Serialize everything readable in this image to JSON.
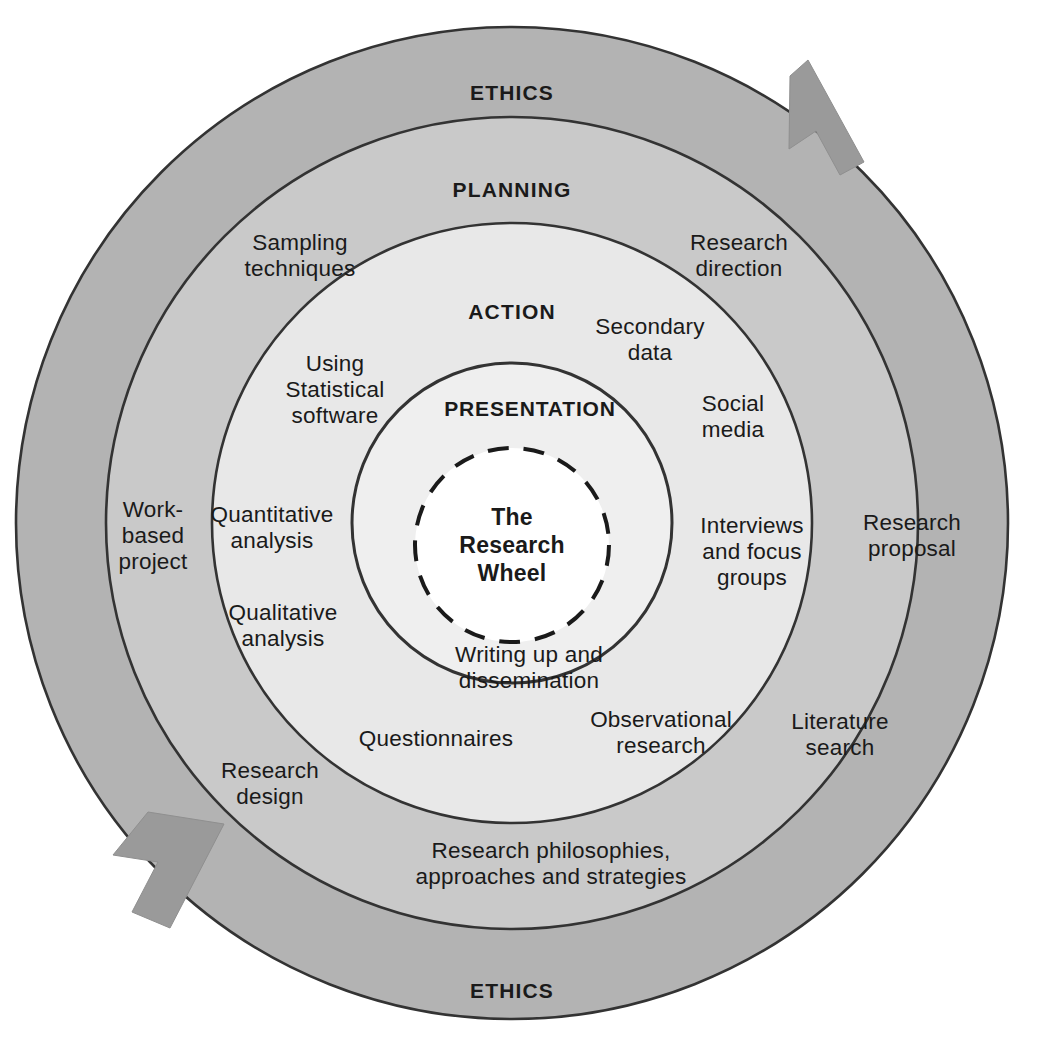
{
  "diagram": {
    "title": "The Research Wheel",
    "type": "concentric-ring-diagram",
    "colors": {
      "ring_ethics_fill": "#b3b3b3",
      "ring_planning_fill": "#c9c9c9",
      "ring_action_fill": "#e2e2e2",
      "ring_presentation_fill": "#ededed",
      "center_fill": "#ffffff",
      "stroke": "#333333",
      "arrow_fill": "#9a9a9a",
      "text": "#1a1a1a",
      "background": "#ffffff"
    },
    "rings": [
      {
        "name": "ethics",
        "label_top": "ETHICS",
        "label_bottom": "ETHICS"
      },
      {
        "name": "planning",
        "label_top": "PLANNING"
      },
      {
        "name": "action",
        "label_top": "ACTION"
      },
      {
        "name": "presentation",
        "label_top": "PRESENTATION"
      }
    ],
    "center": {
      "line1": "The",
      "line2": "Research",
      "line3": "Wheel",
      "text": "The\nResearch\nWheel"
    },
    "arrows": [
      {
        "name": "top-right-arrow",
        "direction": "clockwise-down"
      },
      {
        "name": "bottom-left-arrow",
        "direction": "clockwise-up"
      }
    ],
    "planning_items": [
      {
        "name": "sampling-techniques",
        "text": "Sampling\ntechniques"
      },
      {
        "name": "research-direction",
        "text": "Research\ndirection"
      },
      {
        "name": "work-based-project",
        "text": "Work-\nbased\nproject"
      },
      {
        "name": "research-proposal",
        "text": "Research\nproposal"
      },
      {
        "name": "literature-search",
        "text": "Literature\nsearch"
      },
      {
        "name": "research-design",
        "text": "Research\ndesign"
      },
      {
        "name": "research-philosophies",
        "text": "Research philosophies,\napproaches and strategies"
      }
    ],
    "action_items": [
      {
        "name": "using-statistical-software",
        "text": "Using\nStatistical\nsoftware"
      },
      {
        "name": "secondary-data",
        "text": "Secondary\ndata"
      },
      {
        "name": "social-media",
        "text": "Social\nmedia"
      },
      {
        "name": "quantitative-analysis",
        "text": "Quantitative\nanalysis"
      },
      {
        "name": "qualitative-analysis",
        "text": "Qualitative\nanalysis"
      },
      {
        "name": "interviews-and-focus-groups",
        "text": "Interviews\nand focus\ngroups"
      },
      {
        "name": "questionnaires",
        "text": "Questionnaires"
      },
      {
        "name": "observational-research",
        "text": "Observational\nresearch"
      }
    ],
    "presentation_items": [
      {
        "name": "writing-up-and-dissemination",
        "text": "Writing up and\ndissemination"
      }
    ]
  }
}
